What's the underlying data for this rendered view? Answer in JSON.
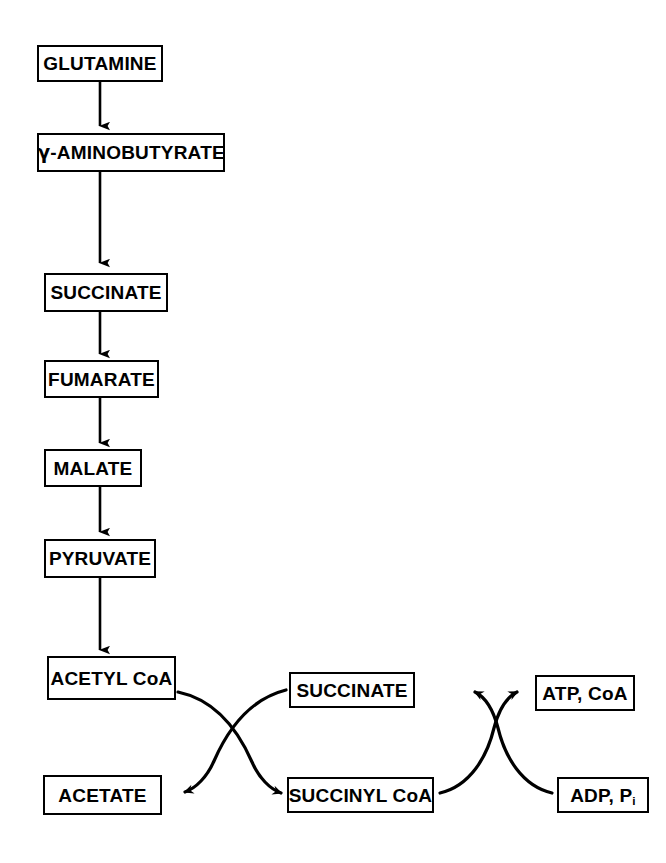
{
  "diagram": {
    "background_color": "#ffffff",
    "line_color": "#000000",
    "nodes": {
      "glutamine": "GLUTAMINE",
      "aminobutyrate_prefix": "γ",
      "aminobutyrate_rest": "-AMINOBUTYRATE",
      "succinate": "SUCCINATE",
      "fumarate": "FUMARATE",
      "malate": "MALATE",
      "pyruvate": "PYRUVATE",
      "acetyl_coa": "ACETYL CoA",
      "acetate": "ACETATE",
      "succinate_2": "SUCCINATE",
      "succinyl_coa": "SUCCINYL CoA",
      "atp_coa": "ATP, CoA",
      "adp_pi_main": "ADP, P",
      "adp_pi_sub": "i"
    },
    "steps": [
      {
        "from": "GLUTAMINE",
        "to": "γ-AMINOBUTYRATE"
      },
      {
        "from": "γ-AMINOBUTYRATE",
        "to": "SUCCINATE"
      },
      {
        "from": "SUCCINATE",
        "to": "FUMARATE"
      },
      {
        "from": "FUMARATE",
        "to": "MALATE"
      },
      {
        "from": "MALATE",
        "to": "PYRUVATE"
      },
      {
        "from": "PYRUVATE",
        "to": "ACETYL CoA"
      },
      {
        "from": "ACETYL CoA",
        "to": "ACETATE"
      },
      {
        "from": "SUCCINATE",
        "to": "SUCCINYL CoA"
      },
      {
        "from": "SUCCINYL CoA",
        "to": "SUCCINATE"
      },
      {
        "from": "ADP, Pᵢ",
        "to": "ATP, CoA"
      }
    ]
  }
}
